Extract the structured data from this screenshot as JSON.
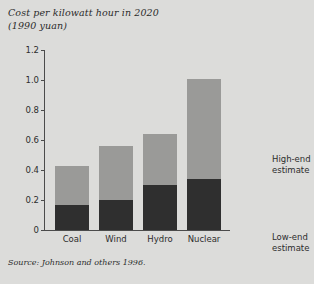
{
  "figure": {
    "title_line1": "Cost per kilowatt hour in 2020",
    "title_line2": "(1990 yuan)",
    "source": "Source: Johnson and others 1996.",
    "background_color": "#dcdcda",
    "low_end_color": "#2f2f2f",
    "high_end_color": "#9a9a98",
    "axis_color": "#4b4b4b"
  },
  "annotations": {
    "high_end_line1": "High-end",
    "high_end_line2": "estimate",
    "low_end_line1": "Low-end",
    "low_end_line2": "estimate"
  },
  "chart_data": {
    "type": "bar",
    "title": "Cost per kilowatt hour in 2020 (1990 yuan)",
    "subtitle": "(1990 yuan)",
    "xlabel": "",
    "ylabel": "",
    "ylim": [
      0,
      1.2
    ],
    "yticks": [
      0,
      0.2,
      0.4,
      0.6,
      0.8,
      1.0,
      1.2
    ],
    "ytick_labels": [
      "0",
      "0.2",
      "0.4",
      "0.6",
      "0.8",
      "1.0",
      "1.2"
    ],
    "grid": false,
    "stacked": true,
    "legend_position": "right-inline-annotations",
    "categories": [
      "Coal",
      "Wind",
      "Hydro",
      "Nuclear"
    ],
    "series": [
      {
        "name": "Low-end estimate",
        "color": "#2f2f2f",
        "values": [
          0.17,
          0.2,
          0.3,
          0.34
        ]
      },
      {
        "name": "High-end estimate",
        "color": "#9a9a98",
        "values": [
          0.43,
          0.56,
          0.64,
          1.01
        ]
      }
    ],
    "note": "Each bar spans from 0 to the high-end estimate; the dark lower portion ends at the low-end estimate."
  }
}
